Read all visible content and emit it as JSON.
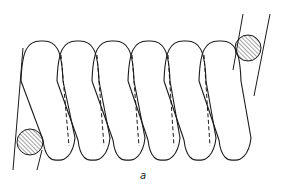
{
  "figure": {
    "caption_label": "a",
    "colors": {
      "stroke": "#1a1a1a",
      "background": "#ffffff",
      "hatch": "#333333"
    },
    "coil": {
      "turns": 6,
      "top_arch_centers_x": [
        42,
        78,
        113,
        149,
        185,
        220
      ],
      "bottom_loop_centers_x": [
        58,
        93,
        128,
        163,
        199,
        234
      ],
      "top_y": 41,
      "bottom_y": 160
    },
    "cross_sections": [
      {
        "name": "lower-left",
        "cx": 30,
        "cy": 142,
        "r": 13
      },
      {
        "name": "upper-right",
        "cx": 248,
        "cy": 48,
        "r": 13
      }
    ]
  }
}
